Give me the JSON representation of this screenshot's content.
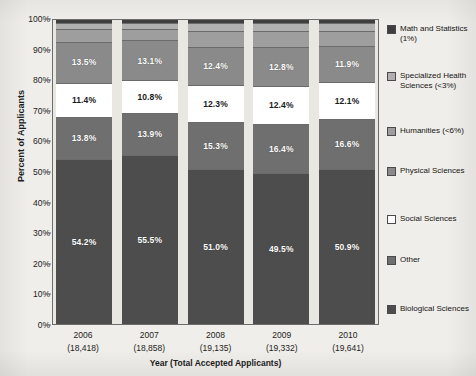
{
  "chart_data": {
    "type": "bar",
    "subtype": "stacked-percent",
    "title": "",
    "xlabel": "Year (Total Accepted Applicants)",
    "ylabel": "Percent of Applicants",
    "ylim": [
      0,
      100
    ],
    "ytick_labels": [
      "0%",
      "10%",
      "20%",
      "30%",
      "40%",
      "50%",
      "60%",
      "70%",
      "80%",
      "90%",
      "100%"
    ],
    "ytick_values": [
      0,
      10,
      20,
      30,
      40,
      50,
      60,
      70,
      80,
      90,
      100
    ],
    "grid": false,
    "legend_position": "right",
    "categories": [
      "2006",
      "2007",
      "2008",
      "2009",
      "2010"
    ],
    "category_sublabels": [
      "(18,418)",
      "(18,858)",
      "(19,135)",
      "(19,332)",
      "(19,641)"
    ],
    "category_totals": [
      18418,
      18858,
      19135,
      19332,
      19641
    ],
    "series": [
      {
        "name": "Biological Sciences",
        "legend_label": "Biological Sciences",
        "color": "#4d4d4d",
        "label_color": "light",
        "values": [
          54.2,
          55.5,
          51.0,
          49.5,
          50.9
        ],
        "data_labels": [
          "54.2%",
          "55.5%",
          "51.0%",
          "49.5%",
          "50.9%"
        ]
      },
      {
        "name": "Other",
        "legend_label": "Other",
        "color": "#6f6f6f",
        "label_color": "light",
        "values": [
          13.8,
          13.9,
          15.3,
          16.4,
          16.6
        ],
        "data_labels": [
          "13.8%",
          "13.9%",
          "15.3%",
          "16.4%",
          "16.6%"
        ]
      },
      {
        "name": "Social Sciences",
        "legend_label": "Social Sciences",
        "color": "#ffffff",
        "label_color": "dark",
        "values": [
          11.4,
          10.8,
          12.3,
          12.4,
          12.1
        ],
        "data_labels": [
          "11.4%",
          "10.8%",
          "12.3%",
          "12.4%",
          "12.1%"
        ]
      },
      {
        "name": "Physical Sciences",
        "legend_label": "Physical Sciences",
        "color": "#8a8a8a",
        "label_color": "light",
        "values": [
          13.5,
          13.1,
          12.4,
          12.8,
          11.9
        ],
        "data_labels": [
          "13.5%",
          "13.1%",
          "12.4%",
          "12.8%",
          "11.9%"
        ]
      },
      {
        "name": "Humanities",
        "legend_label": "Humanities (<6%)",
        "color": "#9e9e9e",
        "label_color": "light",
        "values": [
          4.0,
          3.6,
          5.3,
          5.2,
          5.0
        ],
        "data_labels": [
          "",
          "",
          "",
          "",
          ""
        ]
      },
      {
        "name": "Specialized Health Sciences",
        "legend_label": "Specialized Health Sciences (<3%)",
        "color": "#b0b0b0",
        "label_color": "dark",
        "values": [
          2.1,
          2.1,
          2.7,
          2.7,
          2.5
        ],
        "data_labels": [
          "",
          "",
          "",
          "",
          ""
        ]
      },
      {
        "name": "Math and Statistics",
        "legend_label": "Math and Statistics (1%)",
        "color": "#3f3f3f",
        "label_color": "light",
        "values": [
          1.0,
          1.0,
          1.0,
          1.0,
          1.0
        ],
        "data_labels": [
          "",
          "",
          "",
          "",
          ""
        ]
      }
    ]
  },
  "legend": {
    "items": [
      {
        "label": "Math and Statistics (1%)",
        "color": "#3f3f3f",
        "top": 6
      },
      {
        "label": "Specialized Health Sciences (<3%)",
        "color": "#b0b0b0",
        "top": 53
      },
      {
        "label": "Humanities (<6%)",
        "color": "#9e9e9e",
        "top": 108
      },
      {
        "label": "Physical Sciences",
        "color": "#8a8a8a",
        "top": 148
      },
      {
        "label": "Social Sciences",
        "color": "#ffffff",
        "top": 196
      },
      {
        "label": "Other",
        "color": "#6f6f6f",
        "top": 237
      },
      {
        "label": "Biological Sciences",
        "color": "#4d4d4d",
        "top": 286
      }
    ]
  },
  "colors": {
    "page_background": "#f0eeea",
    "plot_background": "#e9e7e2",
    "frame": "#6d6d6d",
    "text": "#1c1c1c"
  }
}
